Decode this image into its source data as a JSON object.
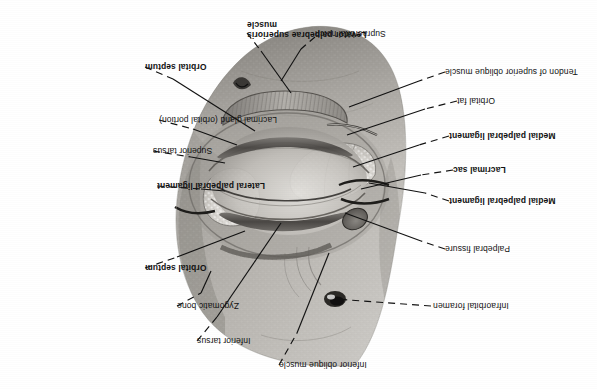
{
  "figure": {
    "orientation_note": "plate rotated 180 degrees",
    "background_color": "#ffffff",
    "ink_color": "#111111"
  },
  "labels": [
    {
      "id": "inferior-oblique-muscle",
      "text": "Inferior oblique muscle",
      "bold": false,
      "align": "right"
    },
    {
      "id": "inferior-tarsus",
      "text": "Inferior tarsus",
      "bold": false,
      "align": "right"
    },
    {
      "id": "zygomatic-bone",
      "text": "Zygomatic bone",
      "bold": false,
      "align": "right"
    },
    {
      "id": "orbital-septum-upper",
      "text": "Orbital septum",
      "bold": true,
      "align": "right"
    },
    {
      "id": "lateral-palpebral-ligament",
      "text": "Lateral palpebral ligament",
      "bold": true,
      "align": "right"
    },
    {
      "id": "superior-tarsus",
      "text": "Superior tarsus",
      "bold": false,
      "align": "right"
    },
    {
      "id": "lacrimal-gland-orbital-portion",
      "text": "Lacrimal gland (orbital portion)",
      "bold": true,
      "align": "right"
    },
    {
      "id": "orbital-septum-lower",
      "text": "Orbital septum",
      "bold": true,
      "align": "right"
    },
    {
      "id": "levator-palpebrae-superioris",
      "text": "Levator palpebrae superioris\nmuscle",
      "bold": true,
      "align": "right"
    },
    {
      "id": "supraorbital-notch",
      "text": "Supraorbital notch",
      "bold": false,
      "align": "right"
    },
    {
      "id": "tendon-of-superior-oblique-muscle",
      "text": "Tendon of superior oblique muscle",
      "bold": false,
      "align": "right"
    },
    {
      "id": "orbital-fat",
      "text": "Orbital fat",
      "bold": false,
      "align": "right"
    },
    {
      "id": "medial-palpebral-ligament-lower",
      "text": "Medial palpebral ligament",
      "bold": true,
      "align": "right"
    },
    {
      "id": "lacrimal-sac",
      "text": "Lacrimal sac",
      "bold": true,
      "align": "right"
    },
    {
      "id": "medial-palpebral-ligament-upper",
      "text": "Medial palpebral ligament",
      "bold": true,
      "align": "right"
    },
    {
      "id": "palpebral-fissure",
      "text": "Palpebral fissure",
      "bold": false,
      "align": "right"
    },
    {
      "id": "infraorbital-foramen",
      "text": "Infraorbital foramen",
      "bold": false,
      "align": "right"
    }
  ],
  "label_text": {
    "inferior_oblique_muscle": "Inferior oblique muscle",
    "inferior_tarsus": "Inferior tarsus",
    "zygomatic_bone": "Zygomatic bone",
    "orbital_septum_upper": "Orbital septum",
    "lateral_palpebral_ligament": "Lateral palpebral ligament",
    "superior_tarsus": "Superior tarsus",
    "lacrimal_gland": "Lacrimal gland",
    "lacrimal_gland_qualifier": " (orbital portion)",
    "orbital_septum_lower": "Orbital septum",
    "levator_line1": "Levator palpebrae superioris",
    "levator_line2": "muscle",
    "supraorbital_notch": "Supraorbital notch",
    "tendon_superior_oblique": "Tendon of superior oblique muscle",
    "orbital_fat": "Orbital fat",
    "medial_palpebral_ligament_lower": "Medial palpebral ligament",
    "lacrimal_sac": "Lacrimal sac",
    "medial_palpebral_ligament_upper": "Medial palpebral ligament",
    "palpebral_fissure": "Palpebral fissure",
    "infraorbital_foramen": "Infraorbital foramen"
  }
}
